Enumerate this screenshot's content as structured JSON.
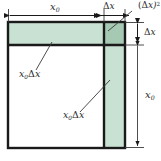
{
  "figure": {
    "kind": "geometric-square-expansion-diagram",
    "colors": {
      "light_green_fill": "#c9e1d2",
      "dark_green_fill": "#a6c9b3",
      "white_fill": "#ffffff",
      "stroke_dark": "#1a1a1a",
      "stroke_thin": "#555555",
      "label_color": "#2b2b2b",
      "background": "#ffffff"
    },
    "regions": [
      {
        "id": "top-strip",
        "label_base": "x",
        "label_sub": "0",
        "label_mid": "Δ",
        "label_tail": "x",
        "fill": "#c9e1d2",
        "meaning": "x0 times delta x"
      },
      {
        "id": "corner-square",
        "label_base": "(",
        "label_sub": "",
        "label_mid": "Δ",
        "label_tail": "x)",
        "label_sup": "2",
        "fill": "#a6c9b3",
        "meaning": "delta x squared"
      },
      {
        "id": "right-strip",
        "label_base": "x",
        "label_sub": "0",
        "label_mid": "Δ",
        "label_tail": "x",
        "fill": "#c9e1d2",
        "meaning": "x0 times delta x"
      },
      {
        "id": "main-square",
        "fill": "#ffffff",
        "meaning": "x0 squared"
      }
    ],
    "labels": {
      "top_dim_x0": {
        "base": "x",
        "sub": "0"
      },
      "top_dim_dx": {
        "delta": "Δ",
        "var": "x"
      },
      "corner_dx2": {
        "open": "(",
        "delta": "Δ",
        "var": "x)",
        "sup": "2"
      },
      "left_region": {
        "base": "x",
        "sub": "0",
        "delta": "Δ",
        "var": "x"
      },
      "inner_region": {
        "base": "x",
        "sub": "0",
        "delta": "Δ",
        "var": "x"
      },
      "right_dim_dx": {
        "delta": "Δ",
        "var": "x"
      },
      "right_dim_x0": {
        "base": "x",
        "sub": "0"
      }
    },
    "dimension_lines": {
      "top_x0": {
        "from_x": 8,
        "to_x": 104,
        "y": 15,
        "arrows": "both"
      },
      "top_dx": {
        "from_x": 104,
        "to_x": 125,
        "y": 15,
        "arrows": "both"
      },
      "right_dx": {
        "from_y": 22,
        "to_y": 45,
        "x": 137,
        "arrows": "both"
      },
      "right_x0": {
        "from_y": 45,
        "to_y": 148,
        "x": 137,
        "arrows": "both"
      }
    },
    "square": {
      "left": 8,
      "top": 22,
      "right": 125,
      "bottom": 148,
      "v_divider_x": 104,
      "h_divider_y": 45
    }
  }
}
